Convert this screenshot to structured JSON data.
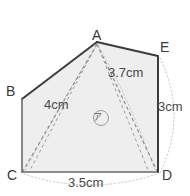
{
  "figure": {
    "type": "geometry-polygon-diagram",
    "background_color": "#ffffff",
    "fill_color": "#eeeeee",
    "outline_color": "#3c3c3c",
    "dashed_color": "#8a8a8a",
    "dotted_color": "#c2c2c2",
    "vertices": [
      {
        "name": "A",
        "label": "A",
        "x": 97,
        "y": 42
      },
      {
        "name": "B",
        "label": "B",
        "x": 22,
        "y": 99
      },
      {
        "name": "C",
        "label": "C",
        "x": 22,
        "y": 172
      },
      {
        "name": "D",
        "label": "D",
        "x": 158,
        "y": 172
      },
      {
        "name": "E",
        "label": "E",
        "x": 158,
        "y": 56
      }
    ],
    "measurements": [
      {
        "name": "slant-AD",
        "label": "3.7cm",
        "value": 3.7,
        "unit": "cm"
      },
      {
        "name": "diagonal-AC",
        "label": "4cm",
        "value": 4,
        "unit": "cm"
      },
      {
        "name": "side-ED",
        "label": "3cm",
        "value": 3,
        "unit": "cm"
      },
      {
        "name": "base-CD",
        "label": "3.5cm",
        "value": 3.5,
        "unit": "cm"
      }
    ],
    "region_marker": {
      "name": "region-a",
      "label": "ア",
      "shape": "circle"
    }
  }
}
